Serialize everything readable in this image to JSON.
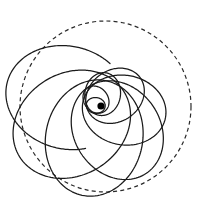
{
  "figure": {
    "background_color": "#ffffff",
    "canvas": {
      "width": 203,
      "height": 212
    },
    "stroke_color": "#1a1a1a",
    "dash_color": "#2a2a2a",
    "focus_color": "#000000"
  },
  "boundary": {
    "name": "dashed-bounding-circle",
    "shape": "circle",
    "center_x": 105.5,
    "center_y": 106.5,
    "radius": 85.5,
    "dash_length": 4,
    "gap_length": 3.2,
    "stroke_width": 1.2
  },
  "focus": {
    "name": "central-focus-point",
    "center_x": 101,
    "center_y": 106,
    "radius": 3.6
  },
  "chart_data": {
    "type": "scatter",
    "subtitle": "Confocal ellipses of growing size, each rotated by a fixed precession angle",
    "xlabel": "",
    "ylabel": "",
    "xlim": [
      20,
      191
    ],
    "ylim": [
      21,
      192
    ],
    "grid": false,
    "legend": null,
    "focus_x": 101,
    "focus_y": 106,
    "precession_step_deg": 46,
    "eccentricity": 0.56,
    "orbits": [
      {
        "index": 0,
        "semi_major": 9.5,
        "rotation_deg": 6,
        "label": "orbit-1"
      },
      {
        "index": 1,
        "semi_major": 14.5,
        "rotation_deg": 52,
        "label": "orbit-2"
      },
      {
        "index": 2,
        "semi_major": 21.5,
        "rotation_deg": 98,
        "label": "orbit-3"
      },
      {
        "index": 3,
        "semi_major": 31.0,
        "rotation_deg": 144,
        "label": "orbit-4"
      },
      {
        "index": 4,
        "semi_major": 42.0,
        "rotation_deg": 190,
        "label": "orbit-5"
      },
      {
        "index": 5,
        "semi_major": 52.0,
        "rotation_deg": 236,
        "label": "orbit-6"
      },
      {
        "index": 6,
        "semi_major": 58.5,
        "rotation_deg": 282,
        "label": "orbit-7"
      },
      {
        "index": 7,
        "semi_major": 61.5,
        "rotation_deg": 328,
        "label": "orbit-8"
      }
    ],
    "open_arc": {
      "label": "outer-terminating-arc",
      "semi_major": 62.0,
      "rotation_deg": 14,
      "start_angle_deg": 96,
      "end_angle_deg": 268,
      "endpoint_x": 71,
      "endpoint_y": 72
    }
  }
}
